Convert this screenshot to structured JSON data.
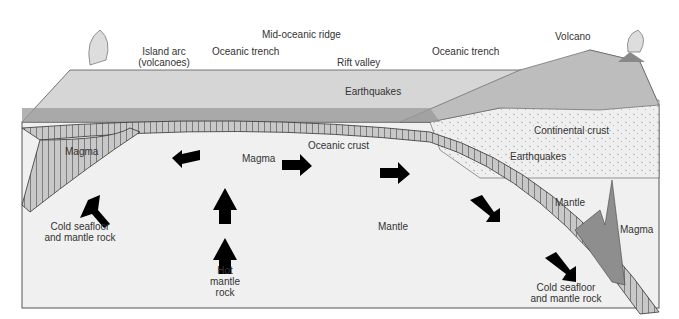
{
  "figure": {
    "labels": {
      "island_arc": "Island arc",
      "island_arc_sub": "(volcanoes)",
      "oceanic_trench_left": "Oceanic trench",
      "mid_oceanic_ridge": "Mid-oceanic ridge",
      "rift_valley": "Rift valley",
      "earthquakes_top": "Earthquakes",
      "oceanic_trench_right": "Oceanic trench",
      "volcano": "Volcano",
      "continental_crust": "Continental crust",
      "earthquakes_right": "Earthquakes",
      "magma_left": "Magma",
      "magma_center": "Magma",
      "oceanic_crust": "Oceanic crust",
      "mantle_center": "Mantle",
      "mantle_right": "Mantle",
      "magma_right": "Magma",
      "cold_left_1": "Cold seafloor",
      "cold_left_2": "and mantle rock",
      "hot_1": "Hot",
      "hot_2": "mantle",
      "hot_3": "rock",
      "cold_right_1": "Cold seafloor",
      "cold_right_2": "and mantle rock"
    },
    "colors": {
      "background": "#ffffff",
      "mantle": "#f0f0f0",
      "surface": "#d6d6d6",
      "ocean_layer": "#9a9a9a",
      "crust_band": "#c8c8c8",
      "continent": "#bdbdbd",
      "arrow": "#000000",
      "magma": "#8e8e8e"
    }
  }
}
